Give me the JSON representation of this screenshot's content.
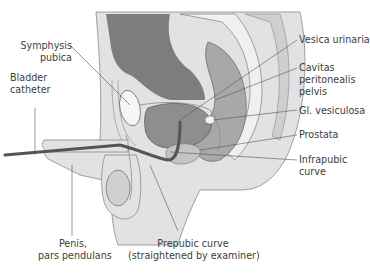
{
  "diagram": {
    "type": "anatomical sagittal section",
    "colors": {
      "background": "#ffffff",
      "soft_tissue_light": "#dedede",
      "soft_tissue_mid": "#c8c8c8",
      "organ_dark": "#8a8a8a",
      "bladder": "#9a9a9a",
      "catheter": "#555555",
      "bone": "#f2f2f2",
      "leader_line": "#555555",
      "text": "#404040"
    },
    "labels": {
      "symphysis": [
        "Symphysis",
        "pubica"
      ],
      "catheter": [
        "Bladder",
        "catheter"
      ],
      "penis": [
        "Penis,",
        "pars pendulans"
      ],
      "prepubic": [
        "Prepubic curve",
        "(straightened by examiner)"
      ],
      "vesica": [
        "Vesica urinaria"
      ],
      "cavitas": [
        "Cavitas",
        "peritonealis",
        "pelvis"
      ],
      "vesiculosa": [
        "Gl. vesiculosa"
      ],
      "prostata": [
        "Prostata"
      ],
      "infrapubic": [
        "Infrapubic",
        "curve"
      ]
    }
  }
}
